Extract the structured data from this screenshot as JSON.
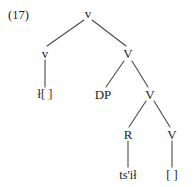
{
  "example": {
    "number_label": "(17)"
  },
  "tree": {
    "nodes": [
      {
        "id": "root-v",
        "label": "v",
        "x": 88,
        "y": 13,
        "kind": "category"
      },
      {
        "id": "spec-v",
        "label": "v",
        "x": 45,
        "y": 53,
        "kind": "category"
      },
      {
        "id": "big-v-1",
        "label": "V",
        "x": 128,
        "y": 53,
        "kind": "category"
      },
      {
        "id": "leaf-voice",
        "label": "ł[  ]",
        "x": 45,
        "y": 94,
        "kind": "leaf"
      },
      {
        "id": "dp",
        "label": "DP",
        "x": 103,
        "y": 94,
        "kind": "category"
      },
      {
        "id": "big-v-2",
        "label": "V",
        "x": 150,
        "y": 94,
        "kind": "category"
      },
      {
        "id": "r",
        "label": "R",
        "x": 128,
        "y": 134,
        "kind": "category"
      },
      {
        "id": "big-v-3",
        "label": "V",
        "x": 172,
        "y": 134,
        "kind": "category"
      },
      {
        "id": "leaf-root",
        "label": "ts'ił",
        "x": 128,
        "y": 175,
        "kind": "leaf"
      },
      {
        "id": "leaf-empty",
        "label": "[  ]",
        "x": 172,
        "y": 175,
        "kind": "leaf"
      }
    ],
    "edges": [
      {
        "id": "e-root-spec",
        "from": "root-v",
        "to": "spec-v",
        "x1": 84,
        "y1": 20,
        "x2": 47,
        "y2": 46
      },
      {
        "id": "e-root-comp",
        "from": "root-v",
        "to": "big-v-1",
        "x1": 92,
        "y1": 20,
        "x2": 126,
        "y2": 46
      },
      {
        "id": "e-spec-leaf",
        "from": "spec-v",
        "to": "leaf-voice",
        "x1": 45,
        "y1": 60,
        "x2": 45,
        "y2": 87
      },
      {
        "id": "e-v1-dp",
        "from": "big-v-1",
        "to": "dp",
        "x1": 124,
        "y1": 61,
        "x2": 106,
        "y2": 87
      },
      {
        "id": "e-v1-v2",
        "from": "big-v-1",
        "to": "big-v-2",
        "x1": 132,
        "y1": 61,
        "x2": 148,
        "y2": 87
      },
      {
        "id": "e-v2-r",
        "from": "big-v-2",
        "to": "r",
        "x1": 146,
        "y1": 101,
        "x2": 129,
        "y2": 127
      },
      {
        "id": "e-v2-v3",
        "from": "big-v-2",
        "to": "big-v-3",
        "x1": 154,
        "y1": 101,
        "x2": 170,
        "y2": 127
      },
      {
        "id": "e-r-leaf",
        "from": "r",
        "to": "leaf-root",
        "x1": 128,
        "y1": 141,
        "x2": 128,
        "y2": 167
      },
      {
        "id": "e-v3-leaf",
        "from": "big-v-3",
        "to": "leaf-empty",
        "x1": 172,
        "y1": 141,
        "x2": 172,
        "y2": 167
      }
    ]
  },
  "style": {
    "line_color": "#4a4a4a",
    "text_color": "#1d1d1d",
    "background": "#ffffff"
  }
}
